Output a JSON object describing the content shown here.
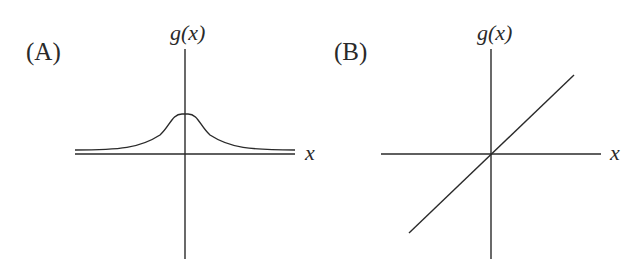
{
  "panels": [
    {
      "label": "(A)",
      "y_axis_label": "g(x)",
      "x_axis_label": "x",
      "curve": "bell-shaped curve, flat-topped peak above origin, approaching a horizontal asymptote slightly above the x-axis"
    },
    {
      "label": "(B)",
      "y_axis_label": "g(x)",
      "x_axis_label": "x",
      "curve": "straight line through origin with positive slope"
    }
  ],
  "colors": {
    "line": "#2a2a2a",
    "background": "#ffffff"
  }
}
